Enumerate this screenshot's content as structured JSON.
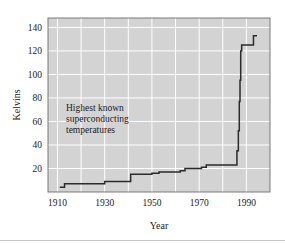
{
  "figure": {
    "background_color": "#ffffff",
    "plot_background_color": "#d3d3d3",
    "gridline_color": "#ffffff",
    "line_color": "#2b2b2b",
    "frame_color": "#6e6e6e",
    "text_color": "#1a1a1a"
  },
  "annotation": {
    "line1": "Highest known",
    "line2": "superconducting",
    "line3": "temperatures"
  },
  "axes": {
    "y_title": "Kelvins",
    "x_title": "Year",
    "y_ticks": [
      20,
      40,
      60,
      80,
      100,
      120,
      140
    ],
    "x_ticks": [
      1910,
      1930,
      1950,
      1970,
      1990
    ],
    "x_gridlines": [
      1910,
      1920,
      1930,
      1940,
      1950,
      1960,
      1970,
      1980,
      1990,
      2000
    ],
    "y_gridlines": [
      20,
      40,
      60,
      80,
      100,
      120,
      140
    ]
  },
  "chart_data": {
    "type": "line",
    "title": "",
    "subtitle": "",
    "xlabel": "Year",
    "ylabel": "Kelvins",
    "xlim": [
      1906,
      2000
    ],
    "ylim": [
      0,
      148
    ],
    "grid": true,
    "legend": "none",
    "step": "post",
    "annotations": [
      "Highest known",
      "superconducting",
      "temperatures"
    ],
    "series": [
      {
        "name": "Highest known superconducting temperature",
        "x": [
          1911,
          1913,
          1930,
          1941,
          1950,
          1953,
          1962,
          1964,
          1971,
          1973,
          1986,
          1986.6,
          1987,
          1987.3,
          1987.6,
          1988,
          1993
        ],
        "values": [
          4,
          7,
          9,
          15,
          16,
          17,
          18,
          20,
          21,
          23,
          35,
          52,
          77,
          95,
          120,
          125,
          133
        ]
      }
    ]
  }
}
